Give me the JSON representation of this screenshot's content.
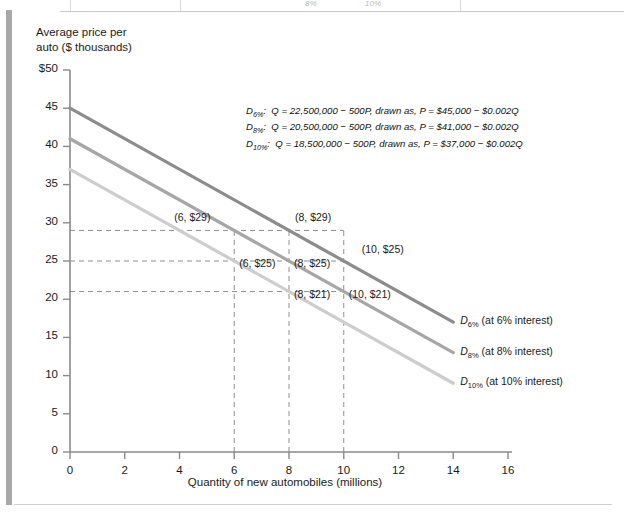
{
  "page": {
    "top_table_fragment": [
      "8%",
      "10%"
    ]
  },
  "chart_data": {
    "type": "line",
    "title": "",
    "xlabel": "Quantity of new automobiles (millions)",
    "ylabel": "Average price per\nauto ($ thousands)",
    "xlim": [
      0,
      16
    ],
    "ylim": [
      0,
      50
    ],
    "xticks": [
      "0",
      "2",
      "4",
      "6",
      "8",
      "10",
      "12",
      "14",
      "16"
    ],
    "yticks": [
      "$50",
      "45",
      "40",
      "35",
      "30",
      "25",
      "20",
      "15",
      "10",
      "5",
      "0"
    ],
    "grid": false,
    "legend_position": "right-of-curve-ends",
    "series": [
      {
        "name": "D6%",
        "label": "D6% (at 6% interest)",
        "label_prefix": "D",
        "label_sub": "6%",
        "label_suffix": " (at 6% interest)",
        "color": "#8c8c8c",
        "intercept": 45,
        "slope": -0.002,
        "x": [
          0,
          14
        ],
        "y": [
          45,
          17
        ]
      },
      {
        "name": "D8%",
        "label": "D8% (at 8% interest)",
        "label_prefix": "D",
        "label_sub": "8%",
        "label_suffix": " (at 8% interest)",
        "color": "#a6a6a6",
        "intercept": 41,
        "slope": -0.002,
        "x": [
          0,
          14
        ],
        "y": [
          41,
          13
        ]
      },
      {
        "name": "D10%",
        "label": "D10% (at 10% interest)",
        "label_prefix": "D",
        "label_sub": "10%",
        "label_suffix": " (at 10% interest)",
        "color": "#cdcdcd",
        "intercept": 37,
        "slope": -0.002,
        "x": [
          0,
          14
        ],
        "y": [
          37,
          9
        ]
      }
    ],
    "annotations": [
      {
        "text": "(6, $29)",
        "x": 6,
        "y": 29
      },
      {
        "text": "(8, $29)",
        "x": 8,
        "y": 29
      },
      {
        "text": "(6, $25)",
        "x": 6,
        "y": 25
      },
      {
        "text": "(8, $25)",
        "x": 8,
        "y": 25
      },
      {
        "text": "(10, $25)",
        "x": 10,
        "y": 25
      },
      {
        "text": "(8, $21)",
        "x": 8,
        "y": 21
      },
      {
        "text": "(10, $21)",
        "x": 10,
        "y": 21
      }
    ],
    "guide_lines": {
      "horizontal_values": [
        29,
        25,
        21
      ],
      "vertical_values": [
        6,
        8,
        10
      ]
    },
    "equations": [
      {
        "name": "D",
        "sub": "6%",
        "text": "Q = 22,500,000 − 500P, drawn as, P = $45,000 − $0.002Q"
      },
      {
        "name": "D",
        "sub": "8%",
        "text": "Q = 20,500,000 − 500P, drawn as, P = $41,000 − $0.002Q"
      },
      {
        "name": "D",
        "sub": "10%",
        "text": "Q = 18,500,000 − 500P, drawn as, P = $37,000 − $0.002Q"
      }
    ]
  }
}
